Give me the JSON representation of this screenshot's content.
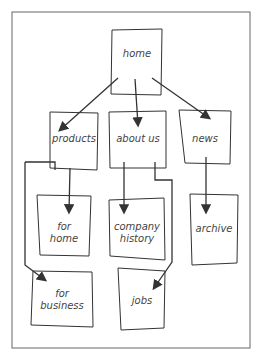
{
  "diagram": {
    "type": "sitemap",
    "nodes": {
      "home": "home",
      "products": "products",
      "about_us": "about us",
      "news": "news",
      "for_home_1": "for",
      "for_home_2": "home",
      "company_history_1": "company",
      "company_history_2": "history",
      "archive": "archive",
      "for_business_1": "for",
      "for_business_2": "business",
      "jobs": "jobs"
    },
    "edges": [
      [
        "home",
        "products"
      ],
      [
        "home",
        "about us"
      ],
      [
        "home",
        "news"
      ],
      [
        "products",
        "for home"
      ],
      [
        "products",
        "for business"
      ],
      [
        "about us",
        "company history"
      ],
      [
        "about us",
        "jobs"
      ],
      [
        "news",
        "archive"
      ]
    ]
  }
}
